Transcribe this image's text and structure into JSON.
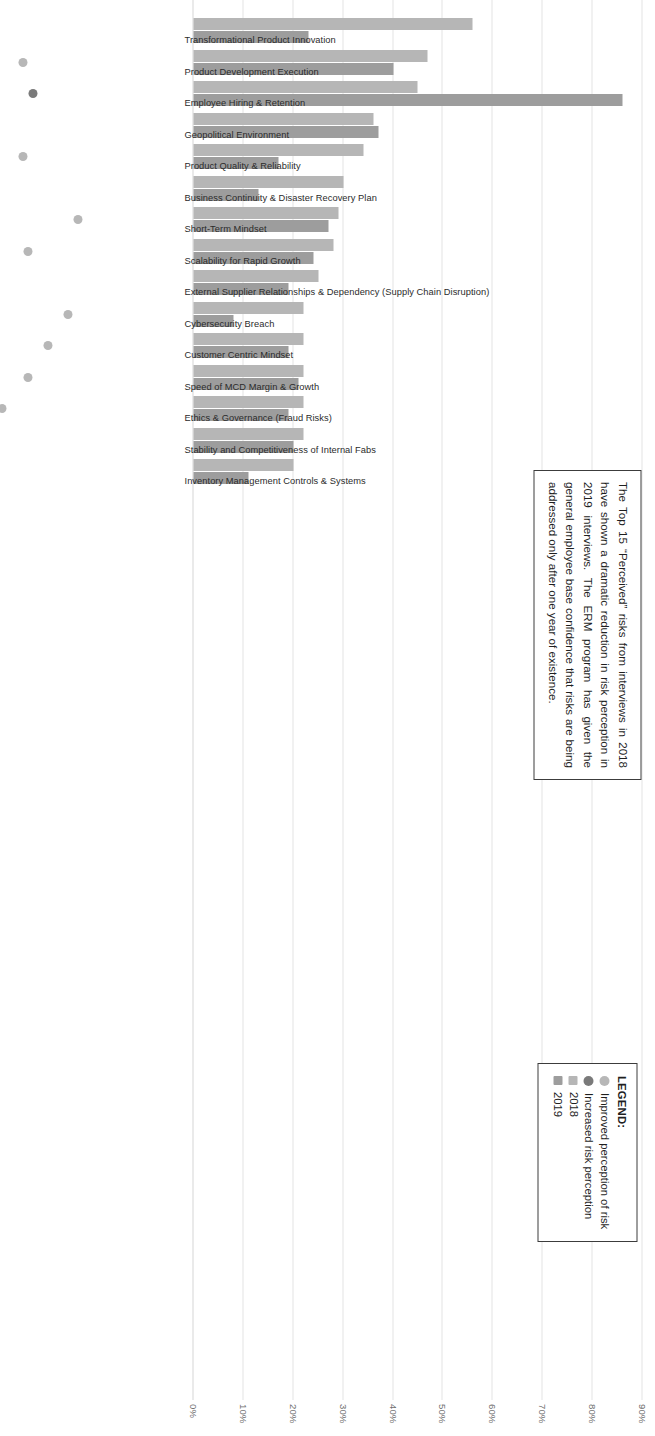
{
  "callout": {
    "text": "The Top 15 “Perceived” risks from interviews in 2018 have shown a dramatic reduction in risk perception in 2019 interviews.  The ERM program has given the general employee base confidence that risks are being addressed only after one year of existence."
  },
  "legend": {
    "title": "LEGEND:",
    "items": [
      {
        "label": "Improved perception of risk",
        "marker": "circle",
        "color": "#b7b7b7"
      },
      {
        "label": "Increased risk perception",
        "marker": "circle",
        "color": "#7a7a7a"
      },
      {
        "label": "2018",
        "marker": "square",
        "color": "#b6b6b6"
      },
      {
        "label": "2019",
        "marker": "square",
        "color": "#9d9d9d"
      }
    ]
  },
  "chart_data": {
    "type": "bar",
    "title": "",
    "xlabel": "",
    "ylabel": "",
    "ylim": [
      0,
      90
    ],
    "ytick_labels": [
      "0%",
      "10%",
      "20%",
      "30%",
      "40%",
      "50%",
      "60%",
      "70%",
      "80%",
      "90%"
    ],
    "ytick_values": [
      0,
      10,
      20,
      30,
      40,
      50,
      60,
      70,
      80,
      90
    ],
    "grid": true,
    "legend_position": "top-right",
    "orientation": "vertical",
    "categories": [
      "Transformational Product Innovation",
      "Product Development Execution",
      "Employee Hiring & Retention",
      "Geopolitical Environment",
      "Product Quality & Reliability",
      "Business Continuity & Disaster Recovery Plan",
      "Short-Term Mindset",
      "Scalability for Rapid Growth",
      "External Supplier Relationships & Dependency (Supply Chain Disruption)",
      "Cybersecurity Breach",
      "Customer Centric Mindset",
      "Speed of MCD Margin & Growth",
      "Ethics & Governance (Fraud Risks)",
      "Stability and Competitiveness of Internal Fabs",
      "Inventory Management Controls & Systems"
    ],
    "series": [
      {
        "name": "2018",
        "color": "#b6b6b6",
        "values": [
          56,
          47,
          45,
          36,
          34,
          30,
          29,
          28,
          25,
          22,
          22,
          22,
          22,
          22,
          20
        ]
      },
      {
        "name": "2019",
        "color": "#9d9d9d",
        "values": [
          23,
          40,
          86,
          37,
          17,
          13,
          27,
          24,
          19,
          8,
          19,
          21,
          19,
          20,
          11
        ]
      }
    ],
    "markers": [
      "improved",
      "improved",
      "increased",
      "none",
      "improved",
      "improved",
      "improved",
      "improved",
      "none",
      "improved",
      "improved",
      "improved",
      "improved",
      "none",
      "improved"
    ]
  }
}
